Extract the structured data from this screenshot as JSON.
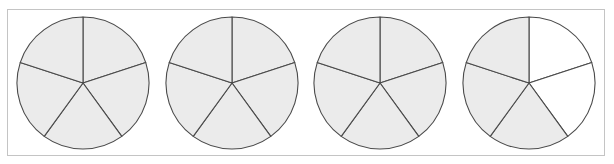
{
  "diagram": {
    "type": "fraction-circles",
    "colors": {
      "shaded": "#ebebeb",
      "unshaded": "#ffffff",
      "stroke": "#4a4a4a",
      "frame": "#c4c4c4"
    },
    "radius": 66,
    "center_y": 83,
    "circles": [
      {
        "id": "circle-1",
        "cx": 83,
        "parts": 5,
        "shaded": [
          true,
          true,
          true,
          true,
          true
        ]
      },
      {
        "id": "circle-2",
        "cx": 232,
        "parts": 5,
        "shaded": [
          true,
          true,
          true,
          true,
          true
        ]
      },
      {
        "id": "circle-3",
        "cx": 380,
        "parts": 5,
        "shaded": [
          true,
          true,
          true,
          true,
          true
        ]
      },
      {
        "id": "circle-4",
        "cx": 529,
        "parts": 5,
        "shaded": [
          false,
          false,
          true,
          true,
          true
        ]
      }
    ],
    "shaded_counts": [
      "5/5",
      "5/5",
      "5/5",
      "3/5"
    ]
  }
}
